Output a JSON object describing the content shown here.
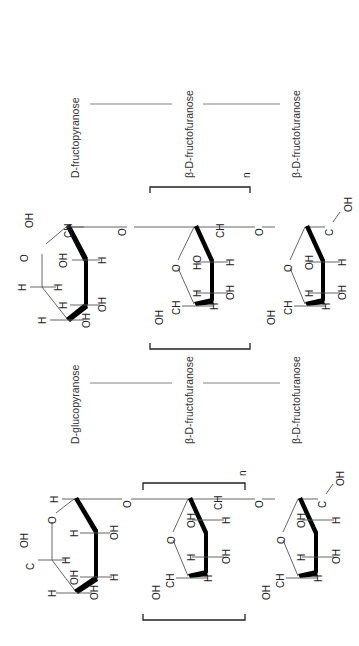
{
  "figure": {
    "orientation": "rotated-90-ccw",
    "top_block": {
      "labels": [
        "D-fructopyranose",
        "β-D-fructofuranose",
        "β-D-fructofuranose"
      ],
      "repeat_index": "n",
      "units": [
        {
          "name": "D-fructopyranose",
          "atoms": [
            "O",
            "OH",
            "CH2",
            "OH",
            "H",
            "OH",
            "H",
            "H",
            "OH",
            "OH",
            "H",
            "H"
          ]
        },
        {
          "name": "β-D-fructofuranose",
          "atoms": [
            "CH2",
            "HO",
            "H",
            "H",
            "OH",
            "O",
            "CH2",
            "OH",
            "H"
          ]
        },
        {
          "name": "β-D-fructofuranose",
          "atoms": [
            "H2C",
            "OH",
            "OH",
            "H",
            "H",
            "OH",
            "O",
            "CH2",
            "OH",
            "H"
          ]
        }
      ],
      "linkers": [
        "O",
        "O"
      ]
    },
    "bottom_block": {
      "labels": [
        "D-glucopyranose",
        "β-D-fructofuranose",
        "β-D-fructofuranose"
      ],
      "repeat_index": "n",
      "units": [
        {
          "name": "D-glucopyranose",
          "atoms": [
            "H",
            "O",
            "OH",
            "H",
            "H2C",
            "OH",
            "H",
            "OH",
            "H",
            "OH",
            "H"
          ]
        },
        {
          "name": "β-D-fructofuranose",
          "atoms": [
            "CH2",
            "OH",
            "H",
            "H",
            "OH",
            "O",
            "CH2",
            "OH",
            "H"
          ]
        },
        {
          "name": "β-D-fructofuranose",
          "atoms": [
            "H2C",
            "OH",
            "OH",
            "H",
            "H",
            "OH",
            "O",
            "CH2",
            "OH",
            "H"
          ]
        }
      ],
      "linkers": [
        "O",
        "O"
      ]
    }
  },
  "atoms": {
    "O": "O",
    "OH": "OH",
    "HO": "HO",
    "H": "H",
    "CH": "CH",
    "H2": "H",
    "C": "C",
    "two": "2"
  }
}
